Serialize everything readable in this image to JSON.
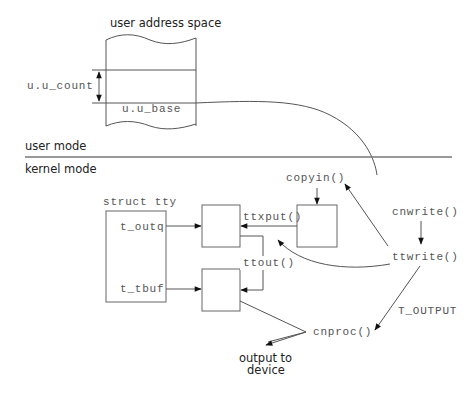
{
  "diagram": {
    "user_space": {
      "title": "user address space",
      "count_label": "u.u_count",
      "base_label": "u.u_base"
    },
    "modes": {
      "user": "user mode",
      "kernel": "kernel mode"
    },
    "struct_tty": {
      "title": "struct tty",
      "fields": [
        "t_outq",
        "t_tbuf"
      ]
    },
    "functions": {
      "copyin": "copyin()",
      "ttxput": "ttxput()",
      "ttout": "ttout()",
      "cnwrite": "cnwrite()",
      "ttwrite": "ttwrite()",
      "cnproc": "cnproc()"
    },
    "flags": {
      "t_output": "T_OUTPUT"
    },
    "output": {
      "line1": "output to",
      "line2": "device"
    },
    "colors": {
      "line": "#555555",
      "arrowhead": "#111111",
      "text": "#222222",
      "mono_text": "#555555"
    }
  }
}
